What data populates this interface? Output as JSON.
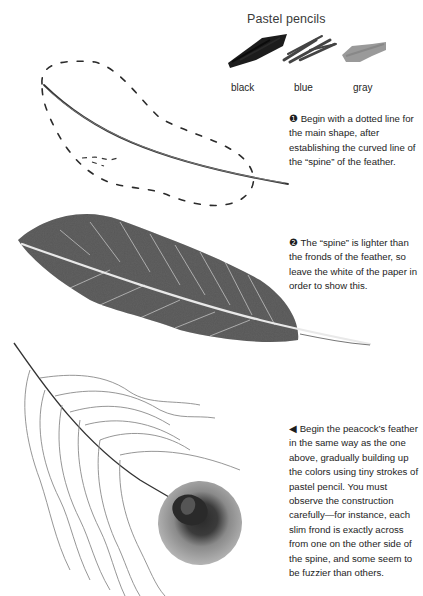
{
  "heading": "Pastel pencils",
  "swatches": [
    {
      "label": "black",
      "color": "#1c1c1c"
    },
    {
      "label": "blue",
      "color": "#4a4a4a"
    },
    {
      "label": "gray",
      "color": "#9a9a9a"
    }
  ],
  "captions": [
    {
      "marker": "❶",
      "text": "Begin with a dotted line for the main shape, after establishing the curved line of the “spine” of the feather."
    },
    {
      "marker": "❷",
      "text": "The “spine” is lighter than the fronds of the feather, so leave the white of the paper in order to show this."
    },
    {
      "marker": "◀",
      "text": "Begin the peacock’s feather in the same way as the one above, gradually building up the colors using tiny strokes of pastel pencil. You must observe the construction carefully—for instance, each slim frond is exactly across from one on the other side of the spine, and some seem to be fuzzier than others."
    }
  ],
  "illustrations": [
    {
      "name": "dotted-outline-feather"
    },
    {
      "name": "shaded-feather"
    },
    {
      "name": "peacock-feather"
    }
  ]
}
